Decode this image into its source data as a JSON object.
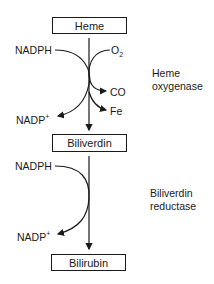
{
  "diagram": {
    "type": "metabolic-pathway",
    "nodes": [
      {
        "id": "heme",
        "label": "Heme"
      },
      {
        "id": "biliverdin",
        "label": "Biliverdin"
      },
      {
        "id": "bilirubin",
        "label": "Bilirubin"
      }
    ],
    "steps": [
      {
        "from": "heme",
        "to": "biliverdin",
        "enzyme_line1": "Heme",
        "enzyme_line2": "oxygenase",
        "inputs": [
          "NADPH",
          "O2"
        ],
        "outputs": [
          "NADP+",
          "CO",
          "Fe"
        ]
      },
      {
        "from": "biliverdin",
        "to": "bilirubin",
        "enzyme_line1": "Biliverdin",
        "enzyme_line2": "reductase",
        "inputs": [
          "NADPH"
        ],
        "outputs": [
          "NADP+"
        ]
      }
    ],
    "labels": {
      "nadph": "NADPH",
      "nadp": "NADP",
      "plus": "+",
      "o": "O",
      "two": "2",
      "co": "CO",
      "fe": "Fe"
    }
  }
}
